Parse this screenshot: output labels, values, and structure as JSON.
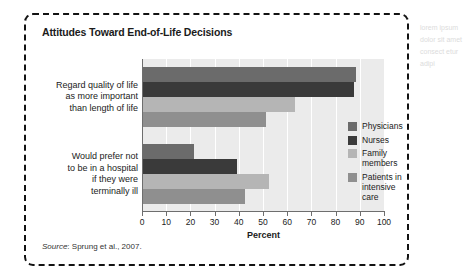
{
  "figure": {
    "title": "Attitudes Toward End-of-Life Decisions",
    "source_word": "Source",
    "source_rest": ": Sprung et al., 2007."
  },
  "chart_data": {
    "type": "bar",
    "orientation": "horizontal",
    "title": "Attitudes Toward End-of-Life Decisions",
    "xlabel": "Percent",
    "ylabel": "",
    "xlim": [
      0,
      100
    ],
    "xticks": [
      0,
      10,
      20,
      30,
      40,
      50,
      60,
      70,
      80,
      90,
      100
    ],
    "grid": true,
    "legend_position": "right-inside",
    "categories": [
      "Regard quality of life\nas more important\nthan length of life",
      "Would prefer not\nto be in a hospital\nif they were\nterminally ill"
    ],
    "series": [
      {
        "name": "Physicians",
        "color": "#6b6b6b",
        "values": [
          88,
          21
        ]
      },
      {
        "name": "Nurses",
        "color": "#3a3a3a",
        "values": [
          87,
          39
        ]
      },
      {
        "name": "Family members",
        "color": "#b5b5b5",
        "values": [
          63,
          52
        ]
      },
      {
        "name": "Patients in\nintensive care",
        "color": "#8f8f8f",
        "values": [
          51,
          42
        ]
      }
    ]
  },
  "side_text": {
    "lines": "lorem\nipsum\ndolor\nsit amet\nconsect\netur\nadipi"
  }
}
